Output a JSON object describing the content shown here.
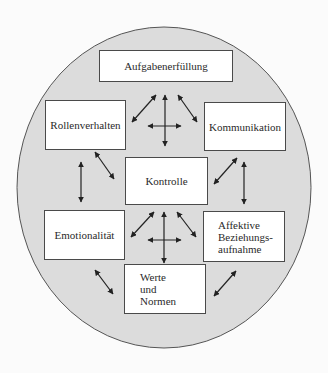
{
  "diagram": {
    "colors": {
      "background": "#fbfbfb",
      "circle_fill": "#dcdcdc",
      "circle_stroke": "#555555",
      "box_fill": "#ffffff",
      "box_stroke": "#4a4a4a",
      "arrow": "#222222",
      "text": "#2a2a2a"
    },
    "nodes": {
      "aufgaben": "Aufgabenerfüllung",
      "rollen": "Rollenverhalten",
      "kommunikation": "Kommunikation",
      "kontrolle": "Kontrolle",
      "emotionalitaet": "Emotionalität",
      "affektive": "Affektive\nBeziehungs-\naufnahme",
      "werte": "Werte\nund\nNormen"
    },
    "connections": [
      {
        "from": "aufgaben",
        "to": "rollen",
        "type": "bidirectional"
      },
      {
        "from": "aufgaben",
        "to": "kontrolle",
        "type": "bidirectional"
      },
      {
        "from": "aufgaben",
        "to": "kommunikation",
        "type": "bidirectional"
      },
      {
        "from": "rollen",
        "to": "kommunikation",
        "type": "bidirectional"
      },
      {
        "from": "rollen",
        "to": "emotionalitaet",
        "type": "bidirectional"
      },
      {
        "from": "rollen",
        "to": "kontrolle",
        "type": "bidirectional"
      },
      {
        "from": "kommunikation",
        "to": "kontrolle",
        "type": "bidirectional"
      },
      {
        "from": "kommunikation",
        "to": "affektive",
        "type": "bidirectional"
      },
      {
        "from": "kontrolle",
        "to": "emotionalitaet",
        "type": "bidirectional"
      },
      {
        "from": "kontrolle",
        "to": "werte",
        "type": "bidirectional"
      },
      {
        "from": "kontrolle",
        "to": "affektive",
        "type": "bidirectional"
      },
      {
        "from": "emotionalitaet",
        "to": "affektive",
        "type": "bidirectional"
      },
      {
        "from": "emotionalitaet",
        "to": "werte",
        "type": "bidirectional"
      },
      {
        "from": "affektive",
        "to": "werte",
        "type": "bidirectional"
      }
    ]
  }
}
